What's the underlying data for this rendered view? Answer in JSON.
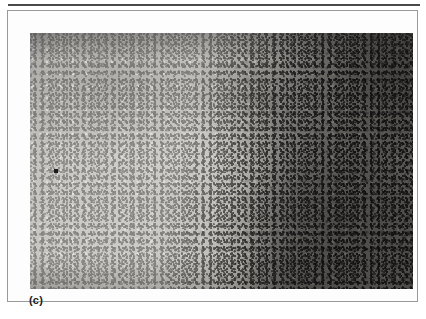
{
  "figure": {
    "panel_label": "(c)",
    "caption": "",
    "image_type": "histological-micrograph",
    "modality": "light-microscopy-grayscale"
  },
  "micrograph": {
    "description": "Grayscale histology section: pale lightly-stained tissue field occupying the left and central portion, sharply transitioning along an irregular vertical boundary to a densely cellular darkly-stained field on the right.",
    "regions": [
      {
        "name": "pale-field",
        "position": "left-and-center",
        "tone": "light-gray",
        "texture": "fine mottled stipple with scattered dark nuclei"
      },
      {
        "name": "dark-dense-field",
        "position": "right",
        "tone": "dark-gray",
        "texture": "coarse densely-packed dark cellular clumps"
      },
      {
        "name": "boundary",
        "position": "center-right",
        "tone": "mid-gray",
        "texture": "irregular vertical interface between the two fields"
      }
    ]
  },
  "colors": {
    "page_background": "#ffffff",
    "rule": "#4a4a4a",
    "frame_border": "#9a9a9a",
    "label_text": "#1b1b1b",
    "pale_field": "#cdccc7",
    "dark_field": "#4e4c4a",
    "nuclei": "#1e1e1e"
  }
}
